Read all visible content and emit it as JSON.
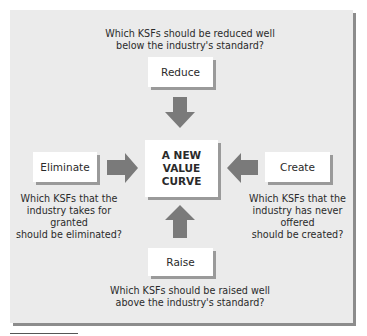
{
  "diagram": {
    "center": {
      "line1": "A NEW",
      "line2": "VALUE",
      "line3": "CURVE"
    },
    "reduce": {
      "label": "Reduce",
      "question_line1": "Which KSFs should be reduced well",
      "question_line2": "below the industry's standard?"
    },
    "eliminate": {
      "label": "Eliminate",
      "question_line1": "Which KSFs that the",
      "question_line2": "industry takes for granted",
      "question_line3": "should be eliminated?"
    },
    "create": {
      "label": "Create",
      "question_line1": "Which KSFs that the",
      "question_line2": "industry has never offered",
      "question_line3": "should be created?"
    },
    "raise": {
      "label": "Raise",
      "question_line1": "Which KSFs should be raised well",
      "question_line2": "above the industry's standard?"
    },
    "colors": {
      "panel": "#ebebeb",
      "box": "#ffffff",
      "arrow": "#7a7a7a",
      "shadow": "#8c8c8c"
    }
  }
}
